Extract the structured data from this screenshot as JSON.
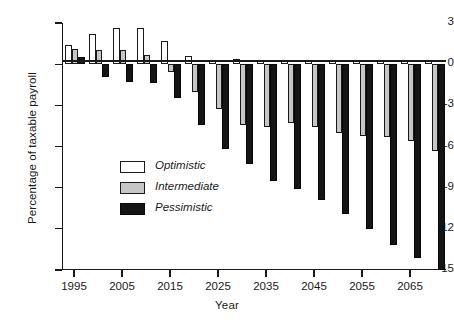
{
  "chart_data": {
    "type": "bar",
    "title": "",
    "xlabel": "Year",
    "ylabel": "Percentage of taxable payroll",
    "ylim": [
      -15,
      3
    ],
    "yticks": [
      3,
      0,
      -3,
      -6,
      -9,
      -12,
      -15
    ],
    "ytick_labels": [
      "3",
      "0",
      "-3",
      "-6",
      "-9",
      "-12",
      "-15"
    ],
    "xticks": [
      1995,
      2005,
      2015,
      2025,
      2035,
      2045,
      2055,
      2065
    ],
    "xtick_labels": [
      "1995",
      "2005",
      "2015",
      "2025",
      "2035",
      "2045",
      "2055",
      "2065"
    ],
    "grid": false,
    "legend_position": "inside-left",
    "categories": [
      1995,
      2000,
      2005,
      2010,
      2015,
      2020,
      2025,
      2030,
      2035,
      2040,
      2045,
      2050,
      2055,
      2060,
      2065,
      2070
    ],
    "series": [
      {
        "name": "Optimistic",
        "color": "#ffffff",
        "values": [
          1.4,
          2.2,
          2.6,
          2.6,
          1.7,
          0.6,
          0.2,
          0.35,
          0.3,
          0.25,
          0.3,
          0.3,
          0.3,
          0.3,
          0.3,
          0.3
        ]
      },
      {
        "name": "Intermediate",
        "color": "#c6c6c6",
        "values": [
          1.1,
          1.0,
          1.0,
          0.7,
          -0.6,
          -2.0,
          -3.3,
          -4.4,
          -4.6,
          -4.3,
          -4.6,
          -5.0,
          -5.2,
          -5.3,
          -5.6,
          -6.3
        ]
      },
      {
        "name": "Pessimistic",
        "color": "#141414",
        "values": [
          0.5,
          -0.9,
          -1.3,
          -1.4,
          -2.5,
          -4.4,
          -6.2,
          -7.3,
          -8.5,
          -9.1,
          -9.9,
          -10.9,
          -12.0,
          -13.2,
          -14.1,
          -15.0
        ]
      }
    ]
  },
  "legend": {
    "items": [
      {
        "label": "Optimistic",
        "key": "opt"
      },
      {
        "label": "Intermediate",
        "key": "int"
      },
      {
        "label": "Pessimistic",
        "key": "pes"
      }
    ]
  }
}
